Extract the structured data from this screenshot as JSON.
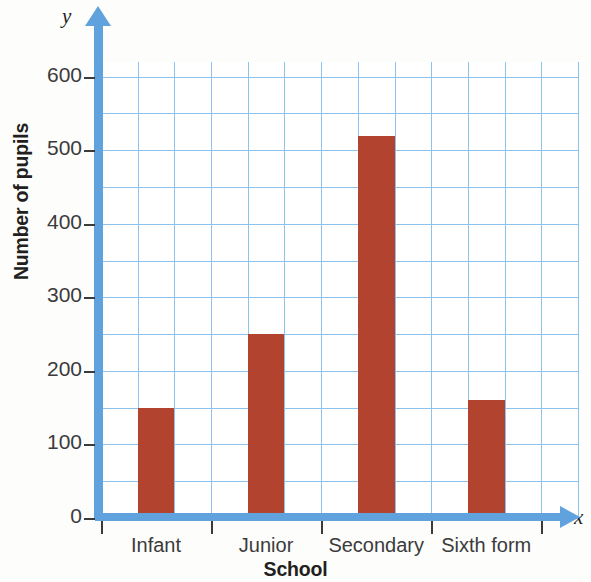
{
  "chart_data": {
    "type": "bar",
    "title": "",
    "xlabel": "School",
    "ylabel": "Number of pupils",
    "x_axis_letter": "x",
    "y_axis_letter": "y",
    "categories": [
      "Infant",
      "Junior",
      "Secondary",
      "Sixth form"
    ],
    "values": [
      150,
      250,
      520,
      160
    ],
    "ylim": [
      0,
      620
    ],
    "y_tick_labels": [
      "0",
      "100",
      "200",
      "300",
      "400",
      "500",
      "600"
    ],
    "y_tick_values": [
      0,
      100,
      200,
      300,
      400,
      500,
      600
    ],
    "y_minor_step": 50,
    "grid": true,
    "legend": "none",
    "bar_color": "#b2432f",
    "axis_color": "#5fa2dd",
    "grid_color": "#8cc2ee",
    "text_color": "#231f20"
  }
}
